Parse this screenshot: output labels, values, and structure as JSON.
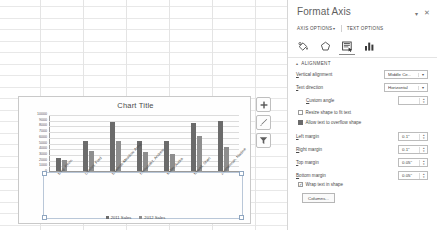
{
  "app": {
    "background": "spreadsheet-grid"
  },
  "chart": {
    "title": "Chart Title",
    "buttons": [
      {
        "name": "chart-elements-button",
        "glyph": "+",
        "tooltip": "Chart Elements"
      },
      {
        "name": "chart-styles-button",
        "glyph": "brush",
        "tooltip": "Chart Styles"
      },
      {
        "name": "chart-filters-button",
        "glyph": "funnel",
        "tooltip": "Chart Filters"
      }
    ]
  },
  "chart_data": {
    "type": "bar",
    "title": "Chart Title",
    "xlabel": "",
    "ylabel": "",
    "ylim": [
      0,
      10000
    ],
    "yticks": [
      10000,
      9000,
      8000,
      7000,
      6000,
      5000,
      4000,
      3000,
      2000,
      1000,
      0
    ],
    "grid": true,
    "legend_position": "bottom",
    "categories": [
      "Bing, Kevin",
      "Cencini, Fred",
      "Edwards-Meadow, Anna",
      "Hernandez, Andrew",
      "Keller, Audra",
      "Newell, Sheri",
      "Zimmerman, Nadine"
    ],
    "series": [
      {
        "name": "2011 Sales",
        "color": "#6b6b6b",
        "values": [
          2200,
          5300,
          8600,
          5200,
          5200,
          8500,
          8800
        ]
      },
      {
        "name": "2012 Sales",
        "color": "#8e8e8e",
        "values": [
          1900,
          3500,
          5300,
          3400,
          2900,
          6200,
          4200
        ]
      }
    ]
  },
  "pane": {
    "title": "Format Axis",
    "minimize_icon": "▾",
    "close_icon": "✕",
    "tabs": [
      {
        "label": "AXIS OPTIONS",
        "caret": "▾",
        "active": true
      },
      {
        "label": "TEXT OPTIONS",
        "caret": "",
        "active": false
      }
    ],
    "icons": [
      {
        "name": "fill-line-icon",
        "selected": false
      },
      {
        "name": "effects-pentagon-icon",
        "selected": false
      },
      {
        "name": "text-box-icon",
        "selected": true
      },
      {
        "name": "axis-options-chart-icon",
        "selected": false
      }
    ],
    "section": {
      "label": "ALIGNMENT",
      "expanded_arrow": "▴"
    },
    "fields": [
      {
        "name": "vertical-alignment",
        "label_pre": "V",
        "label_post": "ertical alignment",
        "type": "combo",
        "value": "Middle Ce...",
        "caret": "▾"
      },
      {
        "name": "text-direction",
        "label_pre": "T",
        "label_post": "ext direction",
        "type": "combo",
        "value": "Horizontal",
        "caret": "▾"
      },
      {
        "name": "custom-angle",
        "label_pre": "C",
        "label_post": "ustom angle",
        "type": "spin",
        "value": "",
        "indent": true
      },
      {
        "name": "left-margin",
        "label_pre": "L",
        "label_post": "eft margin",
        "type": "spin",
        "value": "0.1\""
      },
      {
        "name": "right-margin",
        "label_pre": "R",
        "label_post": "ight margin",
        "type": "spin",
        "value": "0.1\""
      },
      {
        "name": "top-margin",
        "label_pre": "T",
        "label_post": "op margin",
        "type": "spin",
        "value": "0.05\""
      },
      {
        "name": "bottom-margin",
        "label_pre": "B",
        "label_post": "ottom margin",
        "type": "spin",
        "value": "0.05\""
      }
    ],
    "checkboxes": [
      {
        "name": "resize-shape-to-fit-text",
        "label": "Resize shape to fit text",
        "checked": false,
        "kind": "checkbox"
      },
      {
        "name": "allow-text-to-overflow-shape",
        "label": "Allow text to overflow shape",
        "checked": true,
        "kind": "radio"
      },
      {
        "name": "wrap-text-in-shape",
        "label": "Wrap text in shape",
        "checked": true,
        "kind": "checkbox"
      }
    ],
    "columns_button": "Columns..."
  }
}
